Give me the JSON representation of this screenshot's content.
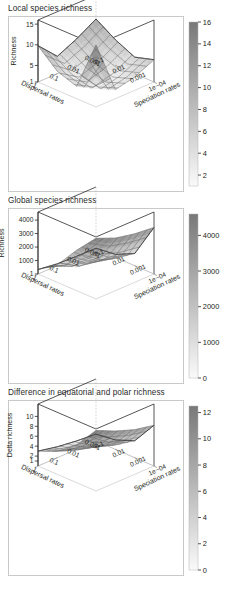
{
  "figure": {
    "panel_count": 3
  },
  "panels": [
    {
      "title": "Local species richness",
      "zlabel": "Richness",
      "xlabel": "Dispersal rates",
      "ylabel": "Speciation rates",
      "xticks": [
        "1",
        "0.1",
        "0.01",
        "0.001"
      ],
      "yticks": [
        "1e−04",
        "0.001",
        "0.01",
        "0.1"
      ],
      "zticks": [
        "1",
        "5",
        "10",
        "15"
      ],
      "cbticks": [
        "2",
        "4",
        "6",
        "8",
        "10",
        "12",
        "14",
        "16"
      ],
      "chart_data": {
        "type": "surface",
        "title": "Local species richness",
        "xlabel": "Dispersal rates",
        "ylabel": "Speciation rates",
        "zlabel": "Richness",
        "x": [
          1,
          0.1,
          0.01,
          0.001
        ],
        "y": [
          0.0001,
          0.001,
          0.01,
          0.1
        ],
        "zlim": [
          1,
          16
        ],
        "clim": [
          1,
          16
        ],
        "colorbar": {
          "ticks": [
            2,
            4,
            6,
            8,
            10,
            12,
            14,
            16
          ],
          "position": "right",
          "cmap": "grayscale-dark-high"
        },
        "grid": true,
        "z": [
          [
            10.2,
            7.2,
            5.0,
            6.4
          ],
          [
            7.4,
            4.3,
            2.6,
            4.2
          ],
          [
            5.2,
            2.6,
            1.4,
            3.2
          ],
          [
            9.8,
            5.6,
            4.0,
            16.0
          ]
        ],
        "z_rows_are": "dispersal rates 1 -> 0.001",
        "z_cols_are": "speciation rates 1e-04 -> 0.1",
        "shape_note": "bowl/saddle: minimum near centre-front, rising to far corner peak ~16"
      }
    },
    {
      "title": "Global species richness",
      "zlabel": "Richness",
      "xlabel": "Dispersal rates",
      "ylabel": "Speciation rates",
      "xticks": [
        "1",
        "0.1",
        "0.01",
        "0.001"
      ],
      "yticks": [
        "1e−04",
        "0.001",
        "0.01",
        "0.1"
      ],
      "zticks": [
        "1",
        "1000",
        "2000",
        "3000",
        "4000"
      ],
      "cbticks": [
        "0",
        "1000",
        "2000",
        "3000",
        "4000"
      ],
      "chart_data": {
        "type": "surface",
        "title": "Global species richness",
        "xlabel": "Dispersal rates",
        "ylabel": "Speciation rates",
        "zlabel": "Richness",
        "x": [
          1,
          0.1,
          0.01,
          0.001
        ],
        "y": [
          0.0001,
          0.001,
          0.01,
          0.1
        ],
        "zlim": [
          1,
          4600
        ],
        "clim": [
          0,
          4600
        ],
        "colorbar": {
          "ticks": [
            0,
            1000,
            2000,
            3000,
            4000
          ],
          "position": "right",
          "cmap": "grayscale-dark-high"
        },
        "grid": true,
        "z": [
          [
            60,
            220,
            900,
            3450
          ],
          [
            80,
            300,
            1150,
            3600
          ],
          [
            140,
            520,
            1700,
            3900
          ],
          [
            330,
            1300,
            3000,
            4500
          ]
        ],
        "z_rows_are": "dispersal rates 1 -> 0.001",
        "z_cols_are": "speciation rates 1e-04 -> 0.1",
        "shape_note": "steep ridge rising toward high speciation and low dispersal; flat low plain in front-left"
      }
    },
    {
      "title": "Difference in equatorial and polar richness",
      "zlabel": "Delta richness",
      "xlabel": "Dispersal rates",
      "ylabel": "Speciation rates",
      "xticks": [
        "1",
        "0.1",
        "0.01",
        "0.001"
      ],
      "yticks": [
        "1e−04",
        "0.001",
        "0.01",
        "0.1"
      ],
      "zticks": [
        "1",
        "2",
        "4",
        "6",
        "8",
        "10"
      ],
      "cbticks": [
        "0",
        "2",
        "4",
        "6",
        "8",
        "10",
        "12"
      ],
      "chart_data": {
        "type": "surface",
        "title": "Difference in equatorial and polar richness",
        "xlabel": "Dispersal rates",
        "ylabel": "Speciation rates",
        "zlabel": "Delta richness",
        "x": [
          1,
          0.1,
          0.01,
          0.001
        ],
        "y": [
          0.0001,
          0.001,
          0.01,
          0.1
        ],
        "zlim": [
          0,
          12.5
        ],
        "clim": [
          0,
          12.5
        ],
        "colorbar": {
          "ticks": [
            0,
            2,
            4,
            6,
            8,
            10,
            12
          ],
          "position": "right",
          "cmap": "grayscale-dark-high"
        },
        "grid": true,
        "z": [
          [
            1.4,
            1.9,
            3.4,
            8.2
          ],
          [
            1.7,
            2.4,
            4.2,
            9.0
          ],
          [
            2.2,
            3.2,
            5.6,
            10.4
          ],
          [
            3.0,
            4.6,
            7.6,
            12.2
          ]
        ],
        "z_rows_are": "dispersal rates 1 -> 0.001",
        "z_cols_are": "speciation rates 1e-04 -> 0.1",
        "shape_note": "monotonic rise toward high speciation rates; ramp from low front-left plateau to ~12 at back-right"
      }
    }
  ],
  "style": {
    "frame_border": "#c9c9c9",
    "axis_line": "#2b2b2b",
    "mesh_line": "#6e6e6e",
    "surface_light": "#f2f2f2",
    "surface_dark": "#8a8a8a",
    "text": "#231f20"
  }
}
